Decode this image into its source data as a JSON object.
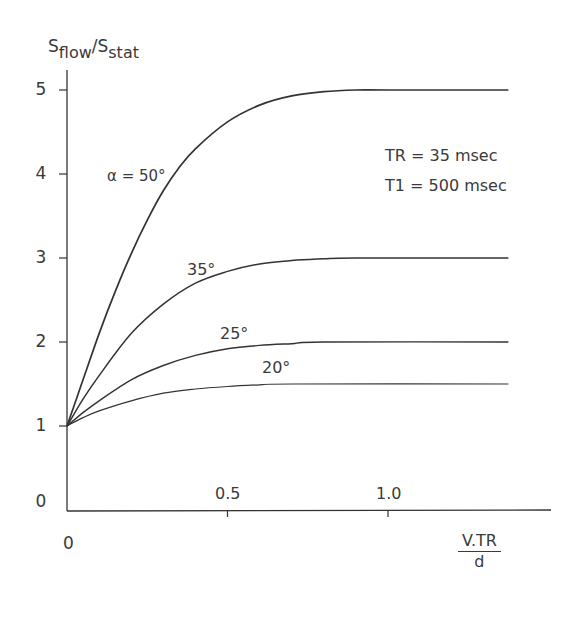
{
  "chart_data": {
    "type": "line",
    "title": "",
    "xlabel": "V.TR / d",
    "xlabel_numerator": "V.TR",
    "xlabel_denominator": "d",
    "ylabel": "Sflow/Sstat",
    "ylabel_parts": {
      "s1": "S",
      "sub1": "flow",
      "slash": "/S",
      "sub2": "stat"
    },
    "xlim": [
      0,
      1.5
    ],
    "ylim": [
      0,
      5.3
    ],
    "grid": false,
    "legend": "inline labels",
    "x_ticks": [
      {
        "value": 0.5,
        "label": "0.5"
      },
      {
        "value": 1.0,
        "label": "1.0"
      }
    ],
    "x_origin_label": "0",
    "y_ticks": [
      {
        "value": 0,
        "label": "0"
      },
      {
        "value": 1,
        "label": "1"
      },
      {
        "value": 2,
        "label": "2"
      },
      {
        "value": 3,
        "label": "3"
      },
      {
        "value": 4,
        "label": "4"
      },
      {
        "value": 5,
        "label": "5"
      }
    ],
    "annotations": {
      "tr": "TR = 35 msec",
      "t1": "T1 = 500 msec"
    },
    "series": [
      {
        "name": "α = 50°",
        "label": "α  = 50°",
        "flip_angle": 50,
        "x": [
          0,
          0.05,
          0.1,
          0.15,
          0.2,
          0.25,
          0.3,
          0.35,
          0.4,
          0.5,
          0.6,
          0.7,
          0.8,
          0.9,
          1.0,
          1.375
        ],
        "values": [
          1,
          1.55,
          2.1,
          2.6,
          3.05,
          3.45,
          3.8,
          4.08,
          4.3,
          4.62,
          4.82,
          4.93,
          4.98,
          5.0,
          5.0,
          5.0
        ]
      },
      {
        "name": "35°",
        "label": "35°",
        "flip_angle": 35,
        "x": [
          0,
          0.05,
          0.1,
          0.2,
          0.3,
          0.4,
          0.5,
          0.6,
          0.7,
          0.8,
          0.9,
          1.375
        ],
        "values": [
          1,
          1.32,
          1.6,
          2.1,
          2.45,
          2.7,
          2.84,
          2.93,
          2.97,
          2.99,
          3.0,
          3.0
        ]
      },
      {
        "name": "25°",
        "label": "25°",
        "flip_angle": 25,
        "x": [
          0,
          0.05,
          0.1,
          0.2,
          0.3,
          0.4,
          0.5,
          0.6,
          0.7,
          0.8,
          1.375
        ],
        "values": [
          1,
          1.16,
          1.3,
          1.55,
          1.72,
          1.84,
          1.92,
          1.96,
          1.98,
          2.0,
          2.0
        ]
      },
      {
        "name": "20°",
        "label": "20°",
        "flip_angle": 20,
        "x": [
          0,
          0.05,
          0.1,
          0.2,
          0.3,
          0.4,
          0.5,
          0.6,
          0.7,
          1.375
        ],
        "values": [
          1,
          1.1,
          1.18,
          1.3,
          1.39,
          1.44,
          1.47,
          1.49,
          1.5,
          1.5
        ]
      }
    ]
  },
  "colors": {
    "line": "#333333",
    "text": "#3a3a3a",
    "background": "#ffffff"
  }
}
